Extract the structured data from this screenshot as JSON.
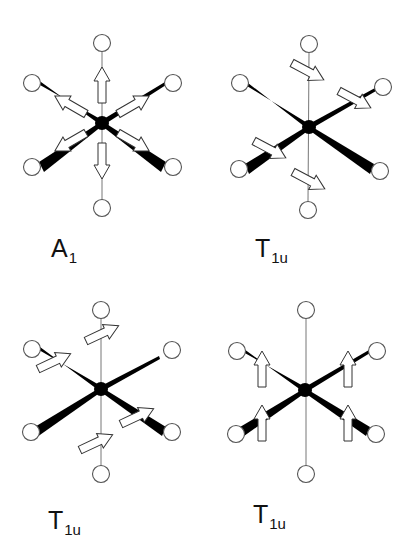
{
  "figure": {
    "panels": [
      {
        "id": "A1",
        "label_main": "A",
        "label_sub": "1",
        "motion": "symmetric stretch - all six arrows point radially outward"
      },
      {
        "id": "T1u-a",
        "label_main": "T",
        "label_sub": "1u",
        "motion": "all ligand arrows point down-right"
      },
      {
        "id": "T1u-b",
        "label_main": "T",
        "label_sub": "1u",
        "motion": "four ligand arrows point up-right"
      },
      {
        "id": "T1u-c",
        "label_main": "T",
        "label_sub": "1u",
        "motion": "four equatorial ligand arrows point up"
      }
    ]
  }
}
